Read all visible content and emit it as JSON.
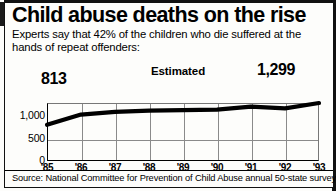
{
  "headline": "Child abuse deaths on the rise",
  "subhead": "Experts say that 42% of the children who die suffered at the hands of repeat offenders:",
  "source": "Source: National Committee for Prevention of Child Abuse annual 50-state survey",
  "callouts": {
    "start_value": "813",
    "end_value": "1,299",
    "estimated_label": "Estimated"
  },
  "colors": {
    "ink": "#000000",
    "paper": "#fdfdfb",
    "grid": "#8a8a8a",
    "line": "#000000"
  },
  "chart_data": {
    "type": "line",
    "title": "Child abuse deaths on the rise",
    "xlabel": "",
    "ylabel": "",
    "categories": [
      "'85",
      "'86",
      "'87",
      "'88",
      "'89",
      "'90",
      "'91",
      "'92",
      "'93"
    ],
    "values": [
      813,
      1040,
      1100,
      1130,
      1140,
      1150,
      1220,
      1180,
      1299
    ],
    "ylim": [
      0,
      1300
    ],
    "yticks": [
      0,
      500,
      1000
    ],
    "ytick_labels": [
      "0",
      "500",
      "1,000"
    ],
    "grid": true,
    "legend": false,
    "annotations": [
      {
        "text": "813",
        "category": "'85",
        "value": 813
      },
      {
        "text": "Estimated",
        "category": "'89",
        "value": 1140
      },
      {
        "text": "1,299",
        "category": "'93",
        "value": 1299
      }
    ]
  }
}
